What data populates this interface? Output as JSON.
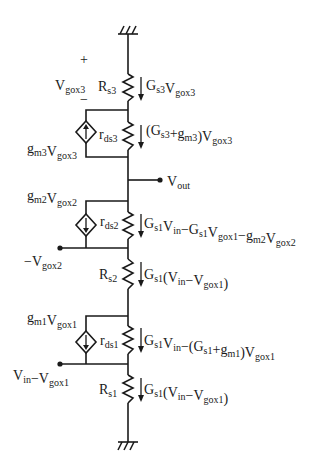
{
  "diagram": {
    "type": "small-signal equivalent circuit (three stacked transistor stages)",
    "colors": {
      "ink": "#1a1a1a",
      "background": "#ffffff"
    },
    "top_ground": {
      "symbol": "ground-hatch"
    },
    "bottom_ground": {
      "symbol": "ground-hatch"
    },
    "stage3": {
      "polarity_plus": "+",
      "polarity_minus": "−",
      "vgox": {
        "main": "V",
        "sub": "gox3"
      },
      "rs": {
        "main": "R",
        "sub": "s3"
      },
      "rs_current": [
        {
          "t": "G",
          "s": "s3"
        },
        {
          "t": "V",
          "s": "gox3"
        }
      ],
      "rds": {
        "main": "r",
        "sub": "ds3"
      },
      "rds_current": [
        {
          "t": "(G",
          "s": "s3"
        },
        {
          "t": "+g",
          "s": "m3"
        },
        {
          "t": ")V",
          "s": "gox3"
        }
      ],
      "source": [
        {
          "t": "g",
          "s": "m3"
        },
        {
          "t": "V",
          "s": "gox3"
        }
      ],
      "source_arrow": "up"
    },
    "output": [
      {
        "t": "V",
        "s": "out"
      }
    ],
    "stage2": {
      "source": [
        {
          "t": "g",
          "s": "m2"
        },
        {
          "t": "V",
          "s": "gox2"
        }
      ],
      "source_arrow": "down",
      "rds": {
        "main": "r",
        "sub": "ds2"
      },
      "rds_current": [
        {
          "t": "G",
          "s": "s1"
        },
        {
          "t": "V",
          "s": "in"
        },
        {
          "t": "−G",
          "s": "s1"
        },
        {
          "t": "V",
          "s": "gox1"
        },
        {
          "t": "−g",
          "s": "m2"
        },
        {
          "t": "V",
          "s": "gox2"
        }
      ],
      "node": [
        {
          "t": "−V",
          "s": "gox2"
        }
      ],
      "rs": {
        "main": "R",
        "sub": "s2"
      },
      "rs_current": [
        {
          "t": "G",
          "s": "s1"
        },
        {
          "t": "(V",
          "s": "in"
        },
        {
          "t": "−V",
          "s": "gox1"
        },
        {
          "t": ")",
          "s": ""
        }
      ]
    },
    "stage1": {
      "source": [
        {
          "t": "g",
          "s": "m1"
        },
        {
          "t": "V",
          "s": "gox1"
        }
      ],
      "source_arrow": "down",
      "rds": {
        "main": "r",
        "sub": "ds1"
      },
      "rds_current": [
        {
          "t": "G",
          "s": "s1"
        },
        {
          "t": "V",
          "s": "in"
        },
        {
          "t": "−(G",
          "s": "s1"
        },
        {
          "t": "+g",
          "s": "m1"
        },
        {
          "t": ")V",
          "s": "gox1"
        }
      ],
      "node": [
        {
          "t": "V",
          "s": "in"
        },
        {
          "t": "−V",
          "s": "gox1"
        }
      ],
      "rs": {
        "main": "R",
        "sub": "s1"
      },
      "rs_current": [
        {
          "t": "G",
          "s": "s1"
        },
        {
          "t": "(V",
          "s": "in"
        },
        {
          "t": "−V",
          "s": "gox1"
        },
        {
          "t": ")",
          "s": ""
        }
      ]
    }
  }
}
